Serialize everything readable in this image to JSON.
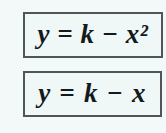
{
  "document": {
    "background_color": "#f3f8f8",
    "equation_boxes": [
      {
        "name": "quadratic-equation",
        "text": "y = k − x²",
        "border_color": "#4e5656",
        "fill_color": "#f0f7f7"
      },
      {
        "name": "linear-equation",
        "text": "y = k − x",
        "border_color": "#4e5656",
        "fill_color": "#f0f7f7"
      }
    ]
  }
}
